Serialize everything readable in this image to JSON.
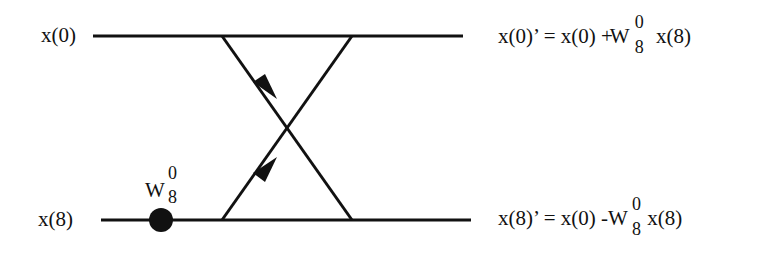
{
  "diagram": {
    "type": "butterfly",
    "inputs": [
      {
        "label": "x(0)"
      },
      {
        "label": "x(8)"
      }
    ],
    "twiddle": {
      "base": "W",
      "superscript": "0",
      "subscript": "8"
    },
    "outputs": [
      {
        "lhs": "x(0)’ = x(0) +",
        "base": "W",
        "superscript": "0",
        "subscript": "8",
        "rhs": "x(8)"
      },
      {
        "lhs": "x(8)’ = x(0) -",
        "base": "W",
        "superscript": "0",
        "subscript": "8",
        "rhs": "x(8)"
      }
    ],
    "colors": {
      "stroke": "#111111",
      "background": "#ffffff"
    }
  }
}
